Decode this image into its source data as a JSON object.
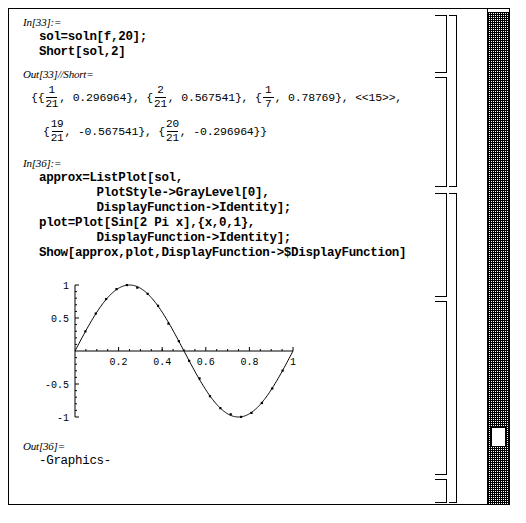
{
  "window": {
    "title": "Mathematica Notebook",
    "background": "#ffffff",
    "border_color": "#000000"
  },
  "cells": [
    {
      "label": "In[33]:=",
      "type": "input",
      "lines": [
        "sol=soln[f,20];",
        "Short[sol,2]"
      ]
    },
    {
      "label": "Out[33]//Short=",
      "type": "output-short",
      "open_brace": "{{",
      "entries_line1": [
        {
          "num": "1",
          "den": "21",
          "value": "0.296964",
          "suffix": "},"
        },
        {
          "num": "2",
          "den": "21",
          "value": "0.567541",
          "suffix": "},"
        },
        {
          "num": "1",
          "den": "7",
          "value": "0.78769",
          "suffix": "},"
        }
      ],
      "elision": "<<15>>,",
      "entries_line2": [
        {
          "num": "19",
          "den": "21",
          "value": "-0.567541",
          "suffix": "},"
        },
        {
          "num": "20",
          "den": "21",
          "value": "-0.296964",
          "suffix": "}}"
        }
      ]
    },
    {
      "label": "In[36]:=",
      "type": "input",
      "lines": [
        "approx=ListPlot[sol,",
        "        PlotStyle->GrayLevel[0],",
        "        DisplayFunction->Identity];",
        "plot=Plot[Sin[2 Pi x],{x,0,1},",
        "        DisplayFunction->Identity];",
        "Show[approx,plot,DisplayFunction->$DisplayFunction]"
      ]
    },
    {
      "label": "Out[36]=",
      "type": "output",
      "lines": [
        "-Graphics-"
      ]
    }
  ],
  "chart_data": {
    "type": "line",
    "title": "",
    "xlabel": "",
    "ylabel": "",
    "xlim": [
      0,
      1
    ],
    "ylim": [
      -1,
      1
    ],
    "grid": false,
    "legend": "none",
    "xticks": [
      0.2,
      0.4,
      0.6,
      0.8,
      1
    ],
    "xtick_labels": [
      "0.2",
      "0.4",
      "0.6",
      "0.8",
      "1"
    ],
    "yticks": [
      1,
      0.5,
      -0.5,
      -1
    ],
    "ytick_labels": [
      "1",
      "0.5",
      "-0.5",
      "-1"
    ],
    "series": [
      {
        "name": "plot",
        "type": "line",
        "function": "Sin[2 Pi x]",
        "color": "#000000"
      },
      {
        "name": "approx",
        "type": "scatter",
        "color": "#000000",
        "x": [
          0.047619,
          0.095238,
          0.142857,
          0.190476,
          0.238095,
          0.285714,
          0.333333,
          0.380952,
          0.428571,
          0.47619,
          0.52381,
          0.571429,
          0.619048,
          0.666667,
          0.714286,
          0.761905,
          0.809524,
          0.857143,
          0.904762,
          0.952381
        ],
        "y": [
          0.296964,
          0.567541,
          0.78769,
          0.937752,
          0.998717,
          0.959493,
          0.866025,
          0.684547,
          0.415415,
          0.149042,
          -0.149042,
          -0.415415,
          -0.684547,
          -0.866025,
          -0.959493,
          -0.998717,
          -0.937752,
          -0.78769,
          -0.567541,
          -0.296964
        ]
      }
    ]
  },
  "scrollbar": {
    "orientation": "vertical",
    "thumb_position_percent": 88
  }
}
